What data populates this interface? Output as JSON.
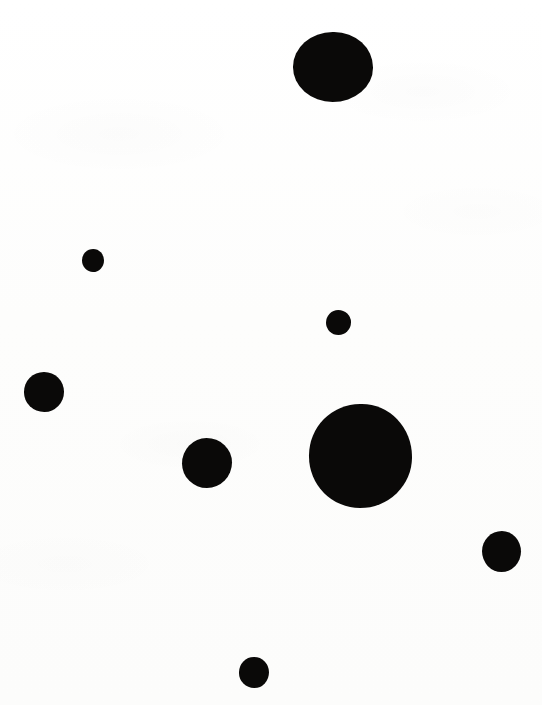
{
  "image": {
    "kind": "dot-pattern",
    "description": "Scattered solid black filled circles of varying sizes on a plain white background",
    "width": 542,
    "height": 705,
    "background_color": "#fdfdfc",
    "dot_color": "#0a0908",
    "dot_count": 8
  },
  "dots": [
    {
      "id": "dot-top-large",
      "label": "large circle, upper center",
      "cx": 333,
      "cy": 67,
      "diameter": 80,
      "width": 80,
      "height": 70,
      "shape": "irr-a"
    },
    {
      "id": "dot-upper-left-small",
      "label": "small circle, upper left",
      "cx": 93,
      "cy": 260,
      "diameter": 22,
      "width": 22,
      "height": 23,
      "shape": "irr-b"
    },
    {
      "id": "dot-middle-small",
      "label": "small circle, middle center",
      "cx": 338,
      "cy": 322,
      "diameter": 25,
      "width": 25,
      "height": 25,
      "shape": "irr-c"
    },
    {
      "id": "dot-left-medium",
      "label": "medium circle, left edge",
      "cx": 44,
      "cy": 392,
      "diameter": 40,
      "width": 40,
      "height": 40,
      "shape": "irr-d"
    },
    {
      "id": "dot-center-largest",
      "label": "largest circle, center right",
      "cx": 360,
      "cy": 456,
      "diameter": 103,
      "width": 103,
      "height": 104,
      "shape": "irr-a"
    },
    {
      "id": "dot-mid-left-medium",
      "label": "medium circle, center left",
      "cx": 207,
      "cy": 463,
      "diameter": 50,
      "width": 50,
      "height": 50,
      "shape": "irr-c"
    },
    {
      "id": "dot-right-medium",
      "label": "medium circle, lower right edge",
      "cx": 501,
      "cy": 551,
      "diameter": 39,
      "width": 39,
      "height": 41,
      "shape": "irr-b"
    },
    {
      "id": "dot-bottom-small",
      "label": "small circle, bottom center",
      "cx": 254,
      "cy": 672,
      "diameter": 30,
      "width": 30,
      "height": 31,
      "shape": "irr-d"
    }
  ]
}
